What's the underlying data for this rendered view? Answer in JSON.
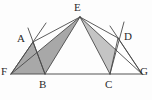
{
  "figure": {
    "background_color": "#fdfdfd",
    "stroke_color": "#4a4a4a",
    "baseline_color": "#555555",
    "shade_dark": "#a8a8a8",
    "shade_light": "#c4c4c4",
    "label_color": "#2b2b2b"
  },
  "points": {
    "E": {
      "label": "E",
      "x": 80,
      "y": 17,
      "label_x": 74,
      "label_y": 2
    },
    "A": {
      "label": "A",
      "x": 33,
      "y": 42,
      "label_x": 17,
      "label_y": 33
    },
    "D": {
      "label": "D",
      "x": 118,
      "y": 38,
      "label_x": 124,
      "label_y": 31
    },
    "F": {
      "label": "F",
      "x": 11,
      "y": 74,
      "label_x": 1,
      "label_y": 66
    },
    "B": {
      "label": "B",
      "x": 45,
      "y": 74,
      "label_x": 39,
      "label_y": 79
    },
    "C": {
      "label": "C",
      "x": 110,
      "y": 74,
      "label_x": 105,
      "label_y": 79
    },
    "G": {
      "label": "G",
      "x": 142,
      "y": 74,
      "label_x": 140,
      "label_y": 66
    }
  },
  "shaded_regions": [
    {
      "name": "triangle-F-A-B",
      "points": "11,74 33,42 45,74",
      "fill": "#a8a8a8"
    },
    {
      "name": "triangle-F-E-B",
      "points": "11,74 80,17 45,74",
      "fill": "#a8a8a8"
    },
    {
      "name": "triangle-E-C-G",
      "points": "80,17 110,74 142,74",
      "fill": "#c4c4c4"
    },
    {
      "name": "triangle-C-D-G",
      "points": "110,74 118,38 142,74",
      "fill": "#ffffff"
    }
  ],
  "segments": [
    {
      "name": "segment-F-G",
      "x1": 11,
      "y1": 74,
      "x2": 142,
      "y2": 74
    },
    {
      "name": "segment-F-E",
      "x1": 11,
      "y1": 74,
      "x2": 80,
      "y2": 17
    },
    {
      "name": "segment-E-G",
      "x1": 80,
      "y1": 17,
      "x2": 142,
      "y2": 74
    },
    {
      "name": "segment-E-B",
      "x1": 80,
      "y1": 17,
      "x2": 45,
      "y2": 74
    },
    {
      "name": "segment-E-C",
      "x1": 80,
      "y1": 17,
      "x2": 110,
      "y2": 74
    },
    {
      "name": "segment-E-A",
      "x1": 80,
      "y1": 17,
      "x2": 33,
      "y2": 42
    },
    {
      "name": "segment-E-D",
      "x1": 80,
      "y1": 17,
      "x2": 118,
      "y2": 38
    },
    {
      "name": "segment-F-A",
      "x1": 11,
      "y1": 74,
      "x2": 33,
      "y2": 42
    },
    {
      "name": "segment-A-B",
      "x1": 33,
      "y1": 42,
      "x2": 45,
      "y2": 74
    },
    {
      "name": "segment-C-D",
      "x1": 110,
      "y1": 74,
      "x2": 118,
      "y2": 38
    },
    {
      "name": "segment-D-G",
      "x1": 118,
      "y1": 38,
      "x2": 142,
      "y2": 74
    },
    {
      "name": "ray-B-A-extended",
      "x1": 45,
      "y1": 74,
      "x2": 28,
      "y2": 28
    },
    {
      "name": "ray-F-A-extended",
      "x1": 11,
      "y1": 74,
      "x2": 46,
      "y2": 23
    },
    {
      "name": "ray-C-D-extended",
      "x1": 110,
      "y1": 74,
      "x2": 124,
      "y2": 22
    },
    {
      "name": "ray-G-D-extended",
      "x1": 142,
      "y1": 74,
      "x2": 110,
      "y2": 26
    }
  ]
}
